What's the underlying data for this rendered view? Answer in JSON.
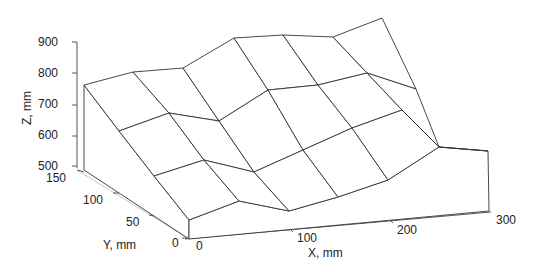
{
  "chart_data": {
    "type": "surface3d",
    "title": "",
    "xlabel": "X, mm",
    "ylabel": "Y, mm",
    "zlabel": "Z, mm",
    "xticks": [
      "0",
      "100",
      "200",
      "300"
    ],
    "yticks": [
      "0",
      "50",
      "100",
      "150"
    ],
    "zticks": [
      "500",
      "600",
      "700",
      "800",
      "900"
    ],
    "xlim": [
      0,
      300
    ],
    "ylim": [
      0,
      150
    ],
    "zlim": [
      500,
      900
    ],
    "x": [
      0,
      50,
      100,
      150,
      200,
      250,
      300
    ],
    "y": [
      150,
      100,
      50,
      0
    ],
    "z": [
      [
        760,
        800,
        810,
        880,
        880,
        870,
        900
      ],
      [
        700,
        730,
        720,
        700,
        740,
        730,
        740
      ],
      [
        620,
        650,
        640,
        640,
        660,
        700,
        720
      ],
      [
        560,
        610,
        580,
        610,
        640,
        690,
        660
      ]
    ]
  },
  "screen": {
    "grid": [
      [
        [
          84,
          85
        ],
        [
          133,
          72
        ],
        [
          183,
          68
        ],
        [
          234,
          38
        ],
        [
          283,
          35
        ],
        [
          333,
          37
        ],
        [
          382,
          18
        ]
      ],
      [
        [
          119,
          131
        ],
        [
          169,
          113
        ],
        [
          219,
          121
        ],
        [
          268,
          90
        ],
        [
          318,
          85
        ],
        [
          367,
          73
        ],
        [
          416,
          89
        ]
      ],
      [
        [
          154,
          176
        ],
        [
          204,
          160
        ],
        [
          254,
          172
        ],
        [
          303,
          150
        ],
        [
          352,
          128
        ],
        [
          402,
          110
        ],
        [
          439,
          147
        ]
      ],
      [
        [
          189,
          220
        ],
        [
          239,
          201
        ],
        [
          289,
          211
        ],
        [
          338,
          197
        ],
        [
          388,
          180
        ],
        [
          439,
          147
        ],
        [
          488,
          151
        ]
      ]
    ]
  },
  "labels": {
    "z_axis": "Z, mm",
    "y_axis": "Y, mm",
    "x_axis": "X, mm",
    "z_ticks": [
      "900",
      "800",
      "700",
      "600",
      "500"
    ],
    "y_ticks": [
      "150",
      "100",
      "50",
      "0"
    ],
    "x_ticks": [
      "0",
      "100",
      "200",
      "300"
    ]
  }
}
